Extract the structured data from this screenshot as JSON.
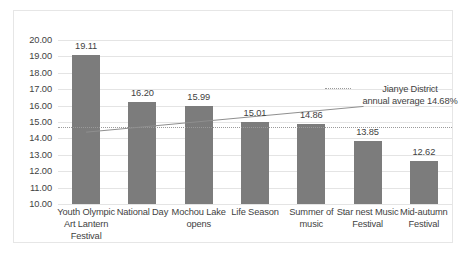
{
  "chart_data": {
    "type": "bar",
    "title": "",
    "xlabel": "",
    "ylabel": "",
    "ylim": [
      10.0,
      20.0
    ],
    "ytick_step": 1.0,
    "grid": true,
    "legend_position": "inside-right",
    "categories": [
      "Youth Olympic Art Lantern Festival",
      "National Day",
      "Mochou Lake opens",
      "Life Season",
      "Summer of music",
      "Star nest Music Festival",
      "Mid-autumn Festival"
    ],
    "values": [
      19.11,
      16.2,
      15.99,
      15.01,
      14.86,
      13.85,
      12.62
    ],
    "value_labels": [
      "19.11",
      "16.20",
      "15.99",
      "15.01",
      "14.86",
      "13.85",
      "12.62"
    ],
    "ytick_labels": [
      "20.00",
      "19.00",
      "18.00",
      "17.00",
      "16.00",
      "15.00",
      "14.00",
      "13.00",
      "12.00",
      "11.00",
      "10.00"
    ],
    "ytick_values": [
      20.0,
      19.0,
      18.0,
      17.0,
      16.0,
      15.0,
      14.0,
      13.0,
      12.0,
      11.0,
      10.0
    ],
    "reference_line": {
      "label": "Jianye District annual average 14.68%",
      "label_line1": "Jianye District",
      "label_line2": "annual average",
      "label_line3": "14.68%",
      "value": 14.68,
      "style": "dotted"
    },
    "trend_line": {
      "style": "solid",
      "start_value": 14.38,
      "end_value": 15.95
    },
    "colors": {
      "bar": "#7c7c7c",
      "gridline": "#e4e4e4",
      "reference_line": "#9a9a9a",
      "trend_line": "#8f8f8f",
      "text": "#3f3f3f",
      "background": "#ffffff",
      "frame_border": "#e6e6e6"
    }
  }
}
